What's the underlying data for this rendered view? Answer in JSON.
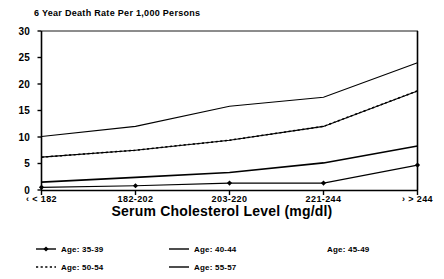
{
  "chart_data": {
    "type": "line",
    "title": "6 Year Death Rate Per 1,000 Persons",
    "xlabel": "Serum Cholesterol Level (mg/dl)",
    "ylabel": "",
    "categories": [
      "< 182",
      "182-202",
      "203-220",
      "221-244",
      "> 244"
    ],
    "xlim": [
      0,
      4
    ],
    "ylim": [
      0,
      30
    ],
    "yticks": [
      0,
      5,
      10,
      15,
      20,
      25,
      30
    ],
    "grid": false,
    "legend_position": "bottom",
    "series": [
      {
        "name": "Age: 35-39",
        "style": "solid-with-diamond-markers",
        "values": [
          0.5,
          0.8,
          1.3,
          1.3,
          4.7
        ]
      },
      {
        "name": "Age: 40-44",
        "style": "solid",
        "values": [
          1.5,
          2.4,
          3.3,
          5.1,
          8.3
        ]
      },
      {
        "name": "Age: 45-49",
        "style": "solid",
        "values": [
          6.2,
          7.5,
          9.4,
          12.0,
          18.7
        ]
      },
      {
        "name": "Age: 50-54",
        "style": "dotted",
        "values": [
          6.2,
          7.5,
          9.4,
          12.0,
          18.7
        ]
      },
      {
        "name": "Age: 55-57",
        "style": "solid",
        "values": [
          10.1,
          12.0,
          15.8,
          17.5,
          24.0
        ]
      }
    ]
  },
  "legend": {
    "entries": [
      {
        "label": "Age: 35-39",
        "marker": "line-with-diamond"
      },
      {
        "label": "Age: 40-44",
        "marker": "solid-line"
      },
      {
        "label": "Age: 45-49",
        "marker": "none"
      },
      {
        "label": "Age: 50-54",
        "marker": "dotted-line"
      },
      {
        "label": "Age: 55-57",
        "marker": "solid-line"
      }
    ]
  },
  "colors": {
    "ink": "#000000",
    "background": "#ffffff"
  }
}
